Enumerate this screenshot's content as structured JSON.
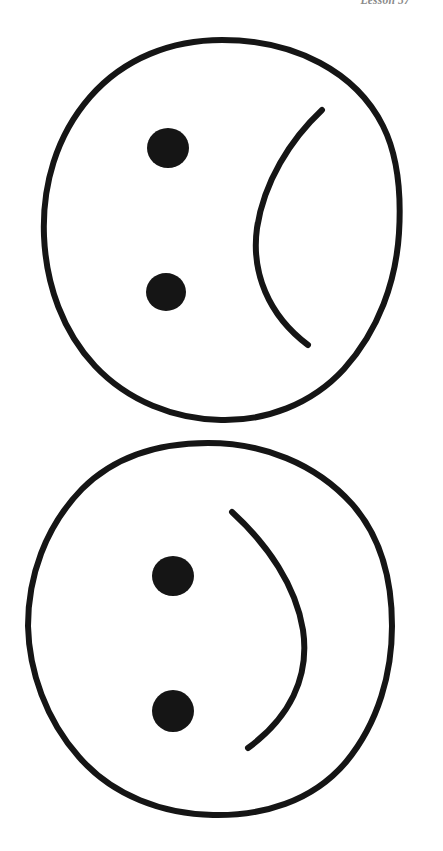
{
  "page": {
    "background_color": "#ffffff",
    "ink_color": "#151515",
    "width": 443,
    "height": 851
  },
  "header": {
    "running_head": "Lesson 57",
    "position": "top-right",
    "clipped": "true"
  },
  "figures": [
    {
      "id": "figure-top",
      "name": "sideways-face-open-right",
      "description": "Hand-drawn circle outline containing two filled dots stacked vertically on the left and a single crescent arc on the right that bows toward the left.",
      "circle": {
        "cx": 222,
        "cy": 230,
        "rx": 178,
        "ry": 190,
        "stroke_width": 6
      },
      "eyes": [
        {
          "name": "eye-upper",
          "cx": 168,
          "cy": 148,
          "r": 20
        },
        {
          "name": "eye-lower",
          "cx": 166,
          "cy": 292,
          "r": 19
        }
      ],
      "mouth": {
        "name": "mouth-arc",
        "shape": "open-paren",
        "start": {
          "x": 322,
          "y": 110
        },
        "end": {
          "x": 308,
          "y": 345
        },
        "bulge_x": 255,
        "stroke_width": 6
      }
    },
    {
      "id": "figure-bottom",
      "name": "sideways-face-open-left",
      "description": "Hand-drawn circle outline containing two filled dots stacked vertically on the left and a single crescent arc in the middle-right that bows toward the right.",
      "circle": {
        "cx": 210,
        "cy": 629,
        "rx": 182,
        "ry": 186,
        "stroke_width": 6
      },
      "eyes": [
        {
          "name": "eye-upper",
          "cx": 173,
          "cy": 576,
          "r": 20
        },
        {
          "name": "eye-lower",
          "cx": 173,
          "cy": 711,
          "r": 21
        }
      ],
      "mouth": {
        "name": "mouth-arc",
        "shape": "close-paren",
        "start": {
          "x": 232,
          "y": 512
        },
        "end": {
          "x": 248,
          "y": 748
        },
        "bulge_x": 305,
        "stroke_width": 6
      }
    }
  ]
}
